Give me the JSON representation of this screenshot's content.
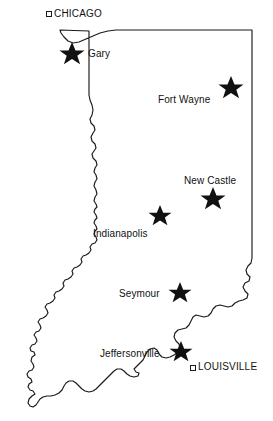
{
  "map": {
    "title": "Indiana state map with selected cities",
    "region_name": "Indiana",
    "background_color": "#ffffff",
    "outline_color": "#1a1a1a",
    "marker_color": "#111111",
    "in_state_marker": "star",
    "out_of_state_marker": "open-square",
    "cities": [
      {
        "name": "Gary",
        "marker": "star",
        "in_state": true,
        "star": {
          "cx": 72,
          "cy": 54,
          "r": 12
        },
        "label": {
          "x": 88,
          "y": 48
        }
      },
      {
        "name": "Fort Wayne",
        "marker": "star",
        "in_state": true,
        "star": {
          "cx": 231,
          "cy": 88,
          "r": 12
        },
        "label": {
          "x": 158,
          "y": 94
        }
      },
      {
        "name": "New Castle",
        "marker": "star",
        "in_state": true,
        "star": {
          "cx": 213,
          "cy": 199,
          "r": 12
        },
        "label": {
          "x": 184,
          "y": 175
        }
      },
      {
        "name": "Indianapolis",
        "marker": "star",
        "in_state": true,
        "star": {
          "cx": 160,
          "cy": 216,
          "r": 11
        },
        "label": {
          "x": 93,
          "y": 228
        }
      },
      {
        "name": "Seymour",
        "marker": "star",
        "in_state": true,
        "star": {
          "cx": 180,
          "cy": 293,
          "r": 11
        },
        "label": {
          "x": 119,
          "y": 288
        }
      },
      {
        "name": "Jeffersonville",
        "marker": "star",
        "in_state": true,
        "star": {
          "cx": 181,
          "cy": 352,
          "r": 11
        },
        "label": {
          "x": 100,
          "y": 348
        }
      },
      {
        "name": "CHICAGO",
        "marker": "open-square",
        "in_state": false,
        "square": {
          "x": 46,
          "y": 11,
          "size": 5
        },
        "label": {
          "x": 54,
          "y": 8
        }
      },
      {
        "name": "LOUISVILLE",
        "marker": "open-square",
        "in_state": false,
        "square": {
          "x": 190,
          "y": 365,
          "size": 5
        },
        "label": {
          "x": 197,
          "y": 361
        }
      }
    ]
  }
}
